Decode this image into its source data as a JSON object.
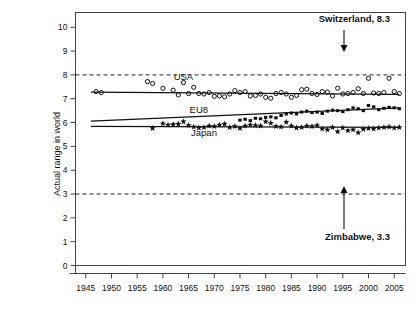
{
  "chart_data": {
    "type": "scatter",
    "title": "",
    "xlabel": "",
    "ylabel": "Actual range in world",
    "xlim": [
      1943,
      2007
    ],
    "ylim": [
      0,
      10.6
    ],
    "xticks": [
      1945,
      1950,
      1955,
      1960,
      1965,
      1970,
      1975,
      1980,
      1985,
      1990,
      1995,
      2000,
      2005
    ],
    "yticks": [
      0,
      1,
      2,
      3,
      4,
      5,
      6,
      7,
      8,
      9,
      10
    ],
    "grid": false,
    "legend_position": "inline-labels",
    "reference_lines": [
      {
        "name": "Switzerland",
        "value": 8.3,
        "drawn_at": 8.0,
        "label": "Switzerland, 8.3",
        "arrow": "down"
      },
      {
        "name": "Zimbabwe",
        "value": 3.3,
        "drawn_at": 3.0,
        "label": "Zimbabwe, 3.3",
        "arrow": "up"
      }
    ],
    "series": [
      {
        "name": "USA",
        "marker": "open-circle",
        "label": "USA",
        "label_x": 1964,
        "label_y": 7.78,
        "trend": {
          "x": [
            1946,
            2006
          ],
          "y": [
            7.28,
            7.18
          ]
        },
        "x": [
          1947,
          1948,
          1957,
          1958,
          1960,
          1962,
          1963,
          1964,
          1965,
          1966,
          1967,
          1968,
          1969,
          1970,
          1971,
          1972,
          1973,
          1974,
          1975,
          1976,
          1977,
          1978,
          1979,
          1980,
          1981,
          1982,
          1983,
          1984,
          1985,
          1986,
          1987,
          1988,
          1989,
          1990,
          1991,
          1992,
          1993,
          1994,
          1995,
          1996,
          1997,
          1998,
          1999,
          2000,
          2001,
          2002,
          2003,
          2004,
          2005,
          2006
        ],
        "y": [
          7.3,
          7.26,
          7.72,
          7.64,
          7.44,
          7.36,
          7.16,
          7.68,
          7.22,
          7.48,
          7.22,
          7.2,
          7.26,
          7.1,
          7.12,
          7.08,
          7.2,
          7.34,
          7.26,
          7.3,
          7.12,
          7.14,
          7.2,
          7.06,
          7.02,
          7.22,
          7.26,
          7.2,
          7.06,
          7.14,
          7.38,
          7.4,
          7.22,
          7.18,
          7.3,
          7.28,
          7.12,
          7.44,
          7.2,
          7.22,
          7.26,
          7.42,
          7.22,
          7.86,
          7.24,
          7.22,
          7.26,
          7.86,
          7.3,
          7.22
        ]
      },
      {
        "name": "EU8",
        "marker": "filled-square",
        "label": "EU8",
        "label_x": 1967,
        "label_y": 6.42,
        "trend": {
          "x": [
            1946,
            2006
          ],
          "y": [
            6.06,
            6.62
          ]
        },
        "x": [
          1975,
          1976,
          1977,
          1978,
          1979,
          1980,
          1981,
          1982,
          1983,
          1984,
          1985,
          1986,
          1987,
          1988,
          1989,
          1990,
          1991,
          1992,
          1993,
          1994,
          1995,
          1996,
          1997,
          1998,
          1999,
          2000,
          2001,
          2002,
          2003,
          2004,
          2005,
          2006
        ],
        "y": [
          6.1,
          6.14,
          6.08,
          6.18,
          6.16,
          6.22,
          6.24,
          6.2,
          6.3,
          6.36,
          6.4,
          6.36,
          6.44,
          6.48,
          6.42,
          6.44,
          6.38,
          6.48,
          6.52,
          6.5,
          6.46,
          6.54,
          6.62,
          6.58,
          6.5,
          6.72,
          6.66,
          6.54,
          6.6,
          6.64,
          6.62,
          6.58
        ]
      },
      {
        "name": "Japan",
        "marker": "star",
        "label": "Japan",
        "label_x": 1968,
        "label_y": 5.42,
        "trend": {
          "x": [
            1946,
            2006
          ],
          "y": [
            5.84,
            5.8
          ]
        },
        "x": [
          1958,
          1960,
          1961,
          1962,
          1963,
          1964,
          1965,
          1966,
          1967,
          1968,
          1969,
          1970,
          1971,
          1972,
          1973,
          1974,
          1975,
          1976,
          1977,
          1978,
          1979,
          1980,
          1981,
          1982,
          1983,
          1984,
          1985,
          1986,
          1987,
          1988,
          1989,
          1990,
          1991,
          1992,
          1993,
          1994,
          1995,
          1996,
          1997,
          1998,
          1999,
          2000,
          2001,
          2002,
          2003,
          2004,
          2005,
          2006
        ],
        "y": [
          5.76,
          5.96,
          5.9,
          5.92,
          5.94,
          6.04,
          5.88,
          5.82,
          5.78,
          5.8,
          5.86,
          5.84,
          5.9,
          5.94,
          5.8,
          5.84,
          5.76,
          5.86,
          5.9,
          5.88,
          5.86,
          6.04,
          5.98,
          5.84,
          5.82,
          6.02,
          5.86,
          5.78,
          5.8,
          5.86,
          5.84,
          5.88,
          5.74,
          5.7,
          5.8,
          5.62,
          5.78,
          5.66,
          5.7,
          5.58,
          5.72,
          5.76,
          5.74,
          5.78,
          5.8,
          5.82,
          5.78,
          5.8
        ]
      }
    ]
  },
  "axis": {
    "y_title": "Actual range in world"
  }
}
